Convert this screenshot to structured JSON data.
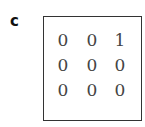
{
  "panel_label": "c",
  "matrix": {
    "rows": [
      [
        "0",
        "0",
        "1"
      ],
      [
        "0",
        "0",
        "0"
      ],
      [
        "0",
        "0",
        "0"
      ]
    ]
  }
}
